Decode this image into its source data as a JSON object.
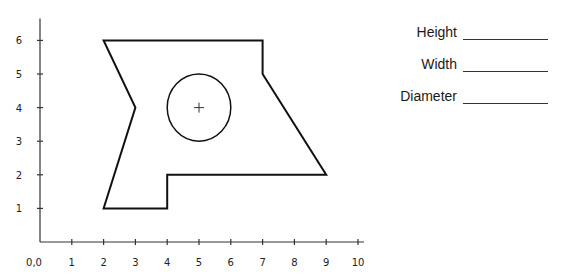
{
  "chart_data": {
    "type": "diagram",
    "title": "",
    "xlabel": "",
    "ylabel": "",
    "origin_label": "0,0",
    "x_ticks": [
      1,
      2,
      3,
      4,
      5,
      6,
      7,
      8,
      9,
      10
    ],
    "y_ticks": [
      1,
      2,
      3,
      4,
      5,
      6
    ],
    "xlim": [
      0,
      10
    ],
    "ylim": [
      0,
      6.5
    ],
    "grid": false,
    "shapes": [
      {
        "kind": "polygon",
        "name": "outer-shape",
        "vertices": [
          [
            2,
            6
          ],
          [
            7,
            6
          ],
          [
            7,
            5
          ],
          [
            9,
            2
          ],
          [
            4,
            2
          ],
          [
            4,
            1
          ],
          [
            2,
            1
          ],
          [
            3,
            4
          ]
        ]
      },
      {
        "kind": "circle",
        "name": "hole",
        "center": [
          5,
          4
        ],
        "radius": 1,
        "center_mark": "+"
      }
    ]
  },
  "fields": [
    {
      "label": "Height",
      "value": ""
    },
    {
      "label": "Width",
      "value": ""
    },
    {
      "label": "Diameter",
      "value": ""
    }
  ]
}
